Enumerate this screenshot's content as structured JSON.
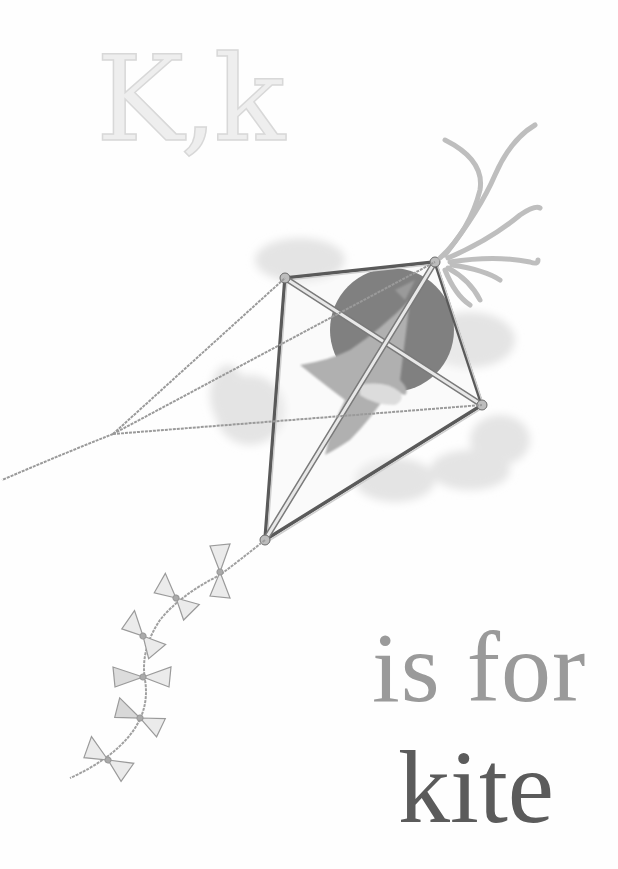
{
  "page": {
    "letters": "K,k",
    "caption": {
      "line1": "is for",
      "line2": "kite"
    }
  },
  "illustration": {
    "subject": "kite-with-bird",
    "elements": [
      "kite-frame",
      "bird",
      "dark-sun-disc",
      "clouds",
      "ribbon-streamers",
      "bow-tail",
      "kite-string"
    ],
    "bow_count": 6,
    "colors": {
      "background": "#fefefe",
      "letters_light": "#eeeeee",
      "caption_mid": "#9a9a9a",
      "caption_dark": "#5b5b5b",
      "pencil_line": "#8a8a8a",
      "disc": "#3e3e3e",
      "cloud": "#e2e2e2"
    }
  }
}
